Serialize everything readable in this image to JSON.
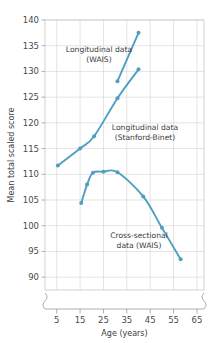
{
  "chart_data": {
    "type": "line",
    "title": "",
    "xlabel": "Age (years)",
    "ylabel": "Mean total scaled score",
    "xlim": [
      0,
      68
    ],
    "ylim": [
      87.5,
      140
    ],
    "xticks": [
      5,
      15,
      25,
      35,
      45,
      55,
      65
    ],
    "yticks": [
      90,
      95,
      100,
      105,
      110,
      115,
      120,
      125,
      130,
      135,
      140
    ],
    "grid": true,
    "legend_position": "inline-annotations",
    "axis_break": {
      "x": true,
      "y": true
    },
    "accent_color": "#4e9fc0",
    "series": [
      {
        "name": "Longitudinal data (WAIS)",
        "color": "#4e9fc0",
        "x": [
          31.0,
          40.0
        ],
        "y": [
          128.1,
          137.5
        ]
      },
      {
        "name": "Longitudinal data (Stanford-Binet)",
        "color": "#4e9fc0",
        "x": [
          5.5,
          15.0,
          21.0,
          31.0,
          40.0
        ],
        "y": [
          111.7,
          115.0,
          117.4,
          124.8,
          130.4
        ]
      },
      {
        "name": "Cross-sectional data (WAIS)",
        "color": "#4e9fc0",
        "x": [
          15.5,
          18.0,
          20.5,
          25.0,
          31.0,
          42.0,
          50.0,
          58.0
        ],
        "y": [
          104.4,
          108.0,
          110.3,
          110.5,
          110.4,
          105.7,
          99.6,
          93.5
        ]
      }
    ],
    "annotations": [
      {
        "name": "longitudinal-wais-label",
        "lines": [
          "Longitudinal data",
          "(WAIS)"
        ],
        "x_px": 99,
        "y_px": 52,
        "anchor": "middle"
      },
      {
        "name": "longitudinal-stanford-binet-label",
        "lines": [
          "Longitudinal data",
          "(Stanford-Binet)"
        ],
        "x_px": 145,
        "y_px": 130,
        "anchor": "middle"
      },
      {
        "name": "cross-sectional-wais-label",
        "lines": [
          "Cross-sectional",
          "data (WAIS)"
        ],
        "x_px": 139,
        "y_px": 238,
        "anchor": "middle"
      }
    ],
    "xtick_labels": [
      "5",
      "15",
      "25",
      "35",
      "45",
      "55",
      "65"
    ],
    "ytick_labels": [
      "90",
      "95",
      "100",
      "105",
      "110",
      "115",
      "120",
      "125",
      "130",
      "135",
      "140"
    ]
  }
}
